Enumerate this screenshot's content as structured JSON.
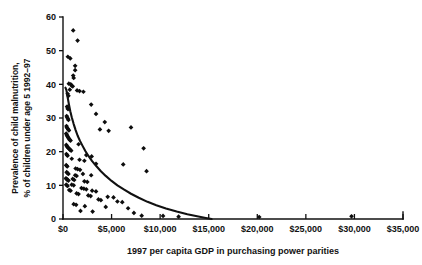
{
  "figure": {
    "background_color": "#ffffff",
    "ink_color": "#111111",
    "caption_partial": ""
  },
  "chart_data": {
    "type": "scatter",
    "title": "",
    "subtitle": "",
    "xlabel": "1997 per capita GDP in purchasing power parities",
    "ylabel": "Prevalence of child malnutrition, % of children under age 5 1992–97",
    "ylabel_line1": "Prevalence of child malnutrition,",
    "ylabel_line2": "% of children under age 5 1992–97",
    "xlim": [
      0,
      35000
    ],
    "ylim": [
      0,
      60
    ],
    "grid": false,
    "legend": "none",
    "xticks": [
      0,
      5000,
      10000,
      15000,
      20000,
      25000,
      30000,
      35000
    ],
    "xticklabels": [
      "$0",
      "$5,000",
      "$10,000",
      "$15,000",
      "$20,000",
      "$25,000",
      "$30,000",
      "$35,000"
    ],
    "yticks": [
      0,
      10,
      20,
      30,
      40,
      50,
      60
    ],
    "yticklabels": [
      "0",
      "10",
      "20",
      "30",
      "40",
      "50",
      "60"
    ],
    "marker": "diamond",
    "marker_color": "#0d0d0d",
    "series": [
      {
        "name": "Countries",
        "points": [
          [
            1050,
            56.0
          ],
          [
            1500,
            53.0
          ],
          [
            500,
            48.2
          ],
          [
            750,
            47.7
          ],
          [
            1250,
            45.5
          ],
          [
            1250,
            44.2
          ],
          [
            1050,
            42.6
          ],
          [
            1100,
            41.9
          ],
          [
            600,
            40.2
          ],
          [
            800,
            40.0
          ],
          [
            900,
            39.6
          ],
          [
            1000,
            39.4
          ],
          [
            700,
            38.4
          ],
          [
            1450,
            38.2
          ],
          [
            1700,
            38.0
          ],
          [
            2100,
            37.8
          ],
          [
            480,
            37.2
          ],
          [
            560,
            36.6
          ],
          [
            2900,
            34.0
          ],
          [
            420,
            33.4
          ],
          [
            470,
            33.0
          ],
          [
            520,
            32.6
          ],
          [
            3400,
            31.2
          ],
          [
            380,
            30.6
          ],
          [
            430,
            30.2
          ],
          [
            500,
            29.8
          ],
          [
            560,
            29.4
          ],
          [
            4300,
            28.8
          ],
          [
            360,
            27.6
          ],
          [
            400,
            27.2
          ],
          [
            470,
            26.9
          ],
          [
            540,
            26.6
          ],
          [
            610,
            26.3
          ],
          [
            3800,
            26.6
          ],
          [
            4700,
            26.2
          ],
          [
            7000,
            27.2
          ],
          [
            330,
            25.4
          ],
          [
            380,
            25.0
          ],
          [
            430,
            24.7
          ],
          [
            490,
            24.4
          ],
          [
            550,
            24.1
          ],
          [
            620,
            23.8
          ],
          [
            700,
            23.5
          ],
          [
            780,
            23.3
          ],
          [
            1600,
            22.2
          ],
          [
            340,
            22.0
          ],
          [
            390,
            21.7
          ],
          [
            450,
            21.4
          ],
          [
            520,
            21.2
          ],
          [
            600,
            21.0
          ],
          [
            680,
            20.7
          ],
          [
            760,
            20.5
          ],
          [
            840,
            20.3
          ],
          [
            8300,
            21.0
          ],
          [
            350,
            19.3
          ],
          [
            410,
            19.0
          ],
          [
            470,
            18.8
          ],
          [
            2400,
            19.0
          ],
          [
            2950,
            18.6
          ],
          [
            900,
            17.9
          ],
          [
            1700,
            17.6
          ],
          [
            2200,
            17.3
          ],
          [
            3400,
            16.4
          ],
          [
            6200,
            16.2
          ],
          [
            8600,
            14.2
          ],
          [
            330,
            16.0
          ],
          [
            380,
            15.8
          ],
          [
            440,
            15.6
          ],
          [
            1300,
            15.0
          ],
          [
            1500,
            14.8
          ],
          [
            1750,
            14.6
          ],
          [
            380,
            13.9
          ],
          [
            470,
            13.6
          ],
          [
            560,
            13.4
          ],
          [
            1250,
            13.0
          ],
          [
            1400,
            12.8
          ],
          [
            2050,
            13.4
          ],
          [
            2900,
            13.0
          ],
          [
            300,
            12.1
          ],
          [
            360,
            11.9
          ],
          [
            420,
            11.7
          ],
          [
            490,
            11.6
          ],
          [
            560,
            11.4
          ],
          [
            1000,
            11.9
          ],
          [
            1150,
            11.6
          ],
          [
            2200,
            11.2
          ],
          [
            2500,
            11.0
          ],
          [
            330,
            10.2
          ],
          [
            400,
            10.0
          ],
          [
            470,
            9.8
          ],
          [
            900,
            10.2
          ],
          [
            1100,
            10.0
          ],
          [
            1900,
            9.2
          ],
          [
            2150,
            9.0
          ],
          [
            2400,
            8.8
          ],
          [
            3000,
            8.4
          ],
          [
            3400,
            8.2
          ],
          [
            640,
            8.6
          ],
          [
            780,
            8.4
          ],
          [
            1400,
            7.6
          ],
          [
            1600,
            7.4
          ],
          [
            2600,
            7.0
          ],
          [
            2850,
            6.8
          ],
          [
            4600,
            6.6
          ],
          [
            5200,
            6.4
          ],
          [
            3650,
            5.8
          ],
          [
            3900,
            5.6
          ],
          [
            5600,
            5.2
          ],
          [
            6100,
            5.0
          ],
          [
            1100,
            4.4
          ],
          [
            1350,
            4.2
          ],
          [
            2250,
            3.8
          ],
          [
            4400,
            3.6
          ],
          [
            6700,
            3.2
          ],
          [
            1800,
            2.4
          ],
          [
            3050,
            2.2
          ],
          [
            7300,
            1.8
          ],
          [
            8100,
            1.0
          ],
          [
            10300,
            0.9
          ],
          [
            11900,
            0.7
          ],
          [
            20200,
            0.6
          ],
          [
            29700,
            0.8
          ]
        ]
      }
    ],
    "fit_curve": {
      "name": "Fitted trend",
      "style": "solid",
      "color": "#111111",
      "points": [
        [
          250,
          39.0
        ],
        [
          350,
          38.3
        ],
        [
          450,
          36.6
        ],
        [
          600,
          34.2
        ],
        [
          750,
          32.0
        ],
        [
          900,
          30.2
        ],
        [
          1100,
          28.2
        ],
        [
          1300,
          26.4
        ],
        [
          1500,
          24.8
        ],
        [
          1750,
          23.2
        ],
        [
          2000,
          21.8
        ],
        [
          2300,
          20.2
        ],
        [
          2600,
          18.8
        ],
        [
          3000,
          17.2
        ],
        [
          3400,
          15.8
        ],
        [
          3900,
          14.2
        ],
        [
          4400,
          12.8
        ],
        [
          5000,
          11.3
        ],
        [
          5600,
          10.0
        ],
        [
          6300,
          8.7
        ],
        [
          7000,
          7.5
        ],
        [
          7800,
          6.3
        ],
        [
          8700,
          5.1
        ],
        [
          9600,
          4.1
        ],
        [
          10600,
          3.1
        ],
        [
          11700,
          2.2
        ],
        [
          12800,
          1.4
        ],
        [
          13800,
          0.8
        ],
        [
          14700,
          0.3
        ],
        [
          15300,
          0.0
        ]
      ]
    }
  }
}
